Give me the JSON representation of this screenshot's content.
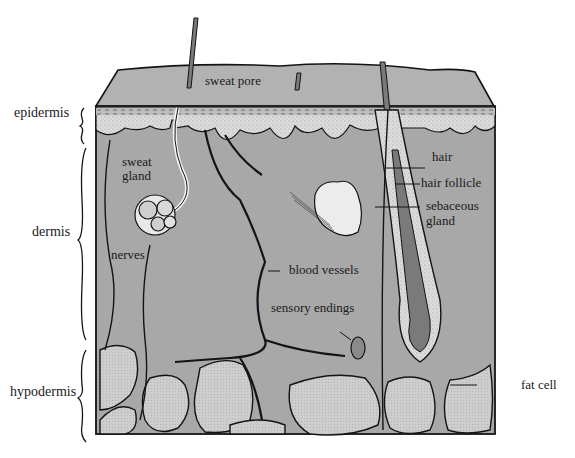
{
  "diagram": {
    "layers": [
      {
        "id": "epidermis",
        "label": "epidermis"
      },
      {
        "id": "dermis",
        "label": "dermis"
      },
      {
        "id": "hypodermis",
        "label": "hypodermis"
      }
    ],
    "structures": {
      "sweat_pore": "sweat pore",
      "sweat_gland": "sweat\ngland",
      "sweat_gland_line1": "sweat",
      "sweat_gland_line2": "gland",
      "nerves": "nerves",
      "blood_vessels": "blood vessels",
      "sensory_endings": "sensory endings",
      "hair": "hair",
      "hair_follicle": "hair follicle",
      "sebaceous_gland_line1": "sebaceous",
      "sebaceous_gland_line2": "gland",
      "fat_cell": "fat cell"
    },
    "colors": {
      "tissue": "#a8a8a8",
      "epidermis_band": "#d6d6d6",
      "fat": "#cfcfcf",
      "outline": "#141414",
      "hair": "#7a7a7a",
      "gland_fill": "#e8e8e8"
    }
  }
}
